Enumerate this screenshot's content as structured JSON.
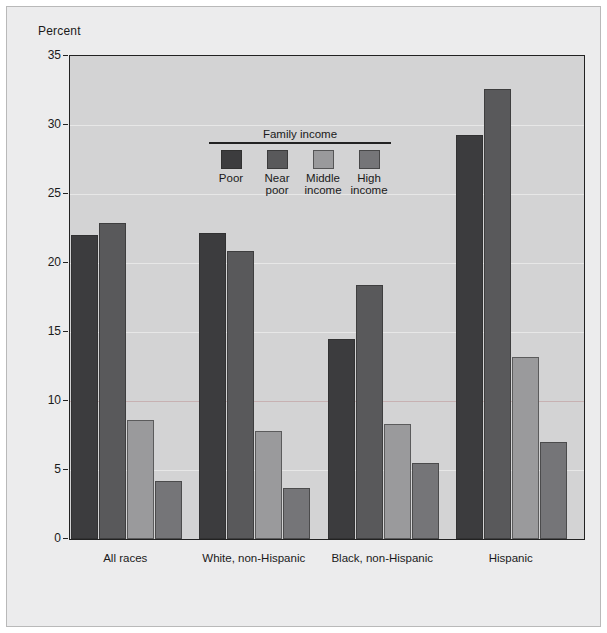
{
  "chart_data": {
    "type": "bar",
    "title": "",
    "subtitle": "",
    "xlabel": "",
    "ylabel": "Percent",
    "ylim": [
      0,
      35
    ],
    "ytick_step": 5,
    "yticks": [
      "0",
      "5",
      "10",
      "15",
      "20",
      "25",
      "30",
      "35"
    ],
    "grid": true,
    "legend_position": "inside-top-left",
    "legend_title": "Family income",
    "categories": [
      "All races",
      "White, non-Hispanic",
      "Black, non-Hispanic",
      "Hispanic"
    ],
    "series": [
      {
        "name": "Poor",
        "color": "#3c3c3e",
        "values": [
          22.0,
          22.2,
          14.5,
          29.3
        ]
      },
      {
        "name": "Near poor",
        "color": "#59595b",
        "values": [
          22.9,
          20.9,
          18.4,
          32.6
        ]
      },
      {
        "name": "Middle income",
        "color": "#9a9a9c",
        "values": [
          8.6,
          7.8,
          8.3,
          13.2
        ]
      },
      {
        "name": "High income",
        "color": "#757578",
        "values": [
          4.2,
          3.7,
          5.5,
          7.0
        ]
      }
    ],
    "legend_labels": [
      "Poor",
      "Near\npoor",
      "Middle\nincome",
      "High\nincome"
    ],
    "plot_background": "#d3d3d4",
    "figure_background": "#ececed",
    "axis_color": "#222222"
  }
}
